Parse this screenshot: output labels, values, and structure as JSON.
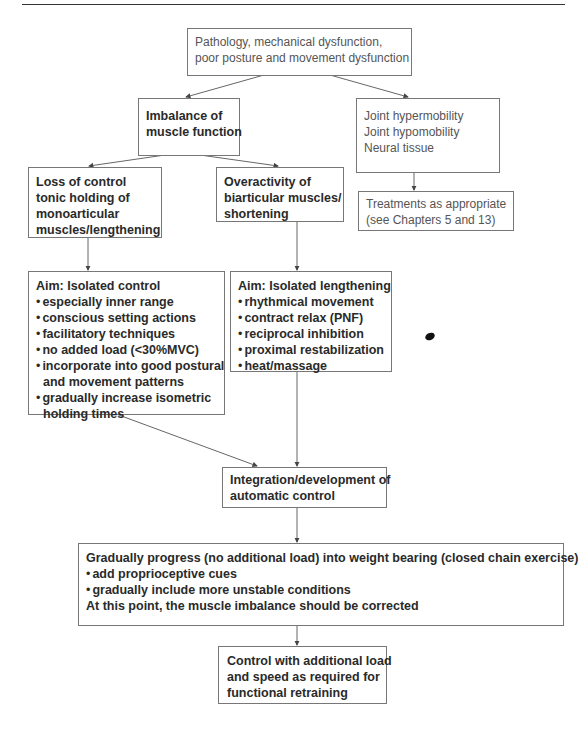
{
  "diagram": {
    "nodes": {
      "pathology": {
        "lines": [
          "Pathology, mechanical dysfunction,",
          "poor posture and movement dysfunction"
        ]
      },
      "imbalance": {
        "lines": [
          "Imbalance of",
          "muscle function"
        ]
      },
      "joint": {
        "lines": [
          "Joint hypermobility",
          "Joint hypomobility",
          "Neural tissue"
        ]
      },
      "treatments": {
        "lines": [
          "Treatments as appropriate",
          "(see Chapters 5 and 13)"
        ]
      },
      "loss_of_control": {
        "lines": [
          "Loss of control",
          "tonic holding of",
          "monoarticular",
          "muscles/lengthening"
        ]
      },
      "overactivity": {
        "lines": [
          "Overactivity of",
          "biarticular muscles/",
          "shortening"
        ]
      },
      "aim_control": {
        "title": "Aim: Isolated control",
        "bullets": [
          "especially inner range",
          "conscious setting actions",
          "facilitatory techniques",
          "no added load (<30%MVC)",
          "incorporate into good postural",
          "and movement patterns",
          "gradually increase isometric",
          "holding times"
        ]
      },
      "aim_lengthening": {
        "title": "Aim: Isolated lengthening",
        "bullets": [
          "rhythmical movement",
          "contract relax (PNF)",
          "reciprocal inhibition",
          "proximal restabilization",
          "heat/massage"
        ]
      },
      "integration": {
        "lines": [
          "Integration/development of",
          "automatic control"
        ]
      },
      "progress": {
        "title": "Gradually progress (no additional load) into weight bearing (closed chain exercise)",
        "bullets": [
          "add proprioceptive cues",
          "gradually include more unstable conditions"
        ],
        "footer": "At this point, the muscle imbalance should be corrected"
      },
      "final": {
        "lines": [
          "Control with additional load",
          "and speed as required for",
          "functional retraining"
        ]
      }
    },
    "edges": [
      [
        "pathology",
        "imbalance"
      ],
      [
        "pathology",
        "joint"
      ],
      [
        "joint",
        "treatments"
      ],
      [
        "imbalance",
        "loss_of_control"
      ],
      [
        "imbalance",
        "overactivity"
      ],
      [
        "loss_of_control",
        "aim_control"
      ],
      [
        "overactivity",
        "aim_lengthening"
      ],
      [
        "aim_control",
        "integration"
      ],
      [
        "aim_lengthening",
        "integration"
      ],
      [
        "integration",
        "progress"
      ],
      [
        "progress",
        "final"
      ]
    ]
  }
}
